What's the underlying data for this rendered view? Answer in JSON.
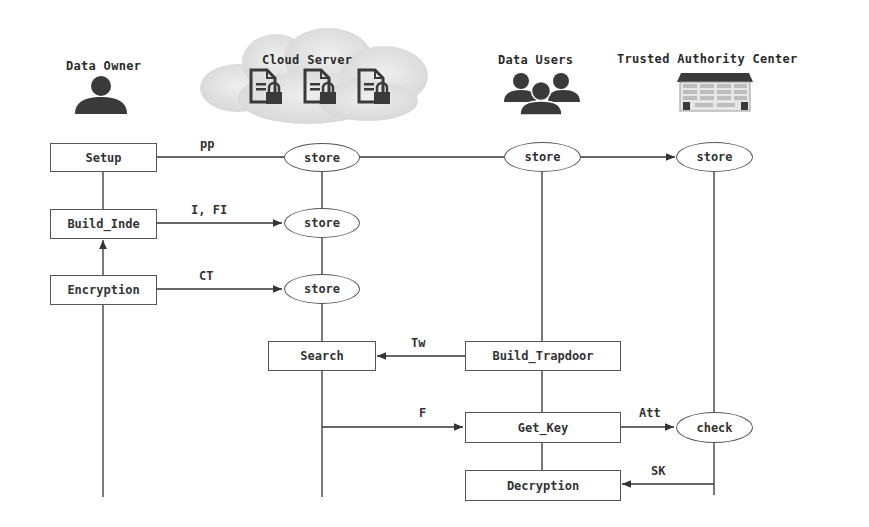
{
  "actors": {
    "data_owner": {
      "label": "Data Owner",
      "icon": "person-icon"
    },
    "cloud_server": {
      "label": "Cloud Server",
      "icon": "cloud-icon",
      "sub_icons": [
        "locked-document-icon",
        "locked-document-icon",
        "locked-document-icon"
      ]
    },
    "data_users": {
      "label": "Data Users",
      "icon": "group-icon"
    },
    "trusted_authority": {
      "label": "Trusted Authority Center",
      "icon": "building-icon"
    }
  },
  "nodes": {
    "setup": "Setup",
    "build_index": "Build_Inde",
    "encryption": "Encryption",
    "store_cloud_1": "store",
    "store_cloud_2": "store",
    "store_cloud_3": "store",
    "store_users": "store",
    "store_tac": "store",
    "search": "Search",
    "build_trapdoor": "Build_Trapdoor",
    "get_key": "Get_Key",
    "decryption": "Decryption",
    "check": "check"
  },
  "edges": {
    "pp": "pp",
    "i_fi": "I, FI",
    "ct": "CT",
    "tw": "Tw",
    "f": "F",
    "att": "Att",
    "sk": "SK"
  },
  "colors": {
    "line": "#333333",
    "icon": "#3a3a3a",
    "cloud": "#e4e4e4"
  }
}
